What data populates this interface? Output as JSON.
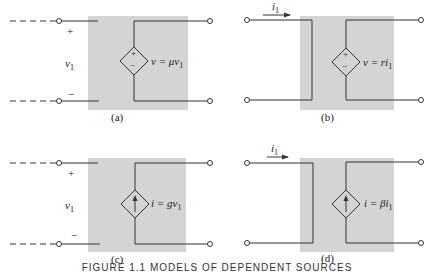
{
  "figure": {
    "panels": [
      {
        "id": "a",
        "caption": "(a)",
        "type": "voltage-controlled voltage source",
        "control_plus": "+",
        "control_minus": "−",
        "control_var": "v",
        "control_sub": "1",
        "source_plus": "+",
        "source_minus": "−",
        "equation_lhs": "v = μv",
        "equation_sub": "1"
      },
      {
        "id": "b",
        "caption": "(b)",
        "type": "current-controlled voltage source",
        "current_label": "i",
        "current_sub": "1",
        "source_plus": "+",
        "source_minus": "−",
        "equation_lhs": "v = ri",
        "equation_sub": "1"
      },
      {
        "id": "c",
        "caption": "(c)",
        "type": "voltage-controlled current source",
        "control_plus": "+",
        "control_minus": "−",
        "control_var": "v",
        "control_sub": "1",
        "equation_lhs": "i = gv",
        "equation_sub": "1"
      },
      {
        "id": "d",
        "caption": "(d)",
        "type": "current-controlled current source",
        "current_label": "i",
        "current_sub": "1",
        "equation_lhs": "i = βi",
        "equation_sub": "1"
      }
    ],
    "bottom_caption": "FIGURE 1.1   MODELS OF DEPENDENT SOURCES",
    "colors": {
      "box_fill": "#d4d4d4",
      "wire": "#333333",
      "background": "#ffffff"
    }
  }
}
